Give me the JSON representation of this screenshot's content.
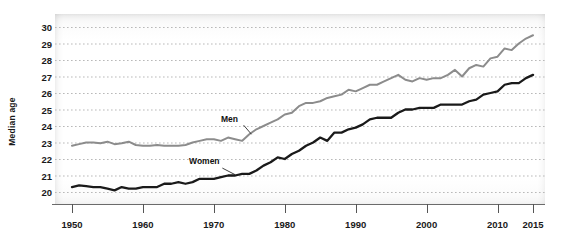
{
  "chart_data": {
    "type": "line",
    "title": "",
    "xlabel": "",
    "ylabel": "Median age",
    "xlim": [
      1950,
      2015
    ],
    "ylim": [
      20,
      30
    ],
    "grid": true,
    "legend_position": "inline-annotation",
    "xticks": [
      1950,
      1960,
      1970,
      1980,
      1990,
      2000,
      2010,
      2015
    ],
    "xtick_labels": [
      "1950",
      "1960",
      "1970",
      "1980",
      "1990",
      "2000",
      "2010",
      "2015"
    ],
    "yticks": [
      20,
      21,
      22,
      23,
      24,
      25,
      26,
      27,
      28,
      29,
      30
    ],
    "ytick_labels": [
      "20",
      "21",
      "22",
      "23",
      "24",
      "25",
      "26",
      "27",
      "28",
      "29",
      "30"
    ],
    "annotations": [
      {
        "text": "Men",
        "x": 1971.0,
        "y": 24.45
      },
      {
        "text": "Women",
        "x": 1966.5,
        "y": 21.85
      }
    ],
    "series": [
      {
        "name": "Men",
        "color": "#8c8c8c",
        "x": [
          1950,
          1951,
          1952,
          1953,
          1954,
          1955,
          1956,
          1957,
          1958,
          1959,
          1960,
          1961,
          1962,
          1963,
          1964,
          1965,
          1966,
          1967,
          1968,
          1969,
          1970,
          1971,
          1972,
          1973,
          1974,
          1975,
          1976,
          1977,
          1978,
          1979,
          1980,
          1981,
          1982,
          1983,
          1984,
          1985,
          1986,
          1987,
          1988,
          1989,
          1990,
          1991,
          1992,
          1993,
          1994,
          1995,
          1996,
          1997,
          1998,
          1999,
          2000,
          2001,
          2002,
          2003,
          2004,
          2005,
          2006,
          2007,
          2008,
          2009,
          2010,
          2011,
          2012,
          2013,
          2014,
          2015
        ],
        "values": [
          22.8,
          22.9,
          23.0,
          23.0,
          22.95,
          23.05,
          22.9,
          22.95,
          23.05,
          22.85,
          22.8,
          22.8,
          22.85,
          22.8,
          22.8,
          22.8,
          22.85,
          23.0,
          23.1,
          23.2,
          23.2,
          23.1,
          23.3,
          23.2,
          23.1,
          23.5,
          23.8,
          24.0,
          24.2,
          24.4,
          24.7,
          24.8,
          25.2,
          25.4,
          25.4,
          25.5,
          25.7,
          25.8,
          25.9,
          26.2,
          26.1,
          26.3,
          26.5,
          26.5,
          26.7,
          26.9,
          27.1,
          26.8,
          26.7,
          26.9,
          26.8,
          26.9,
          26.9,
          27.1,
          27.4,
          27.0,
          27.5,
          27.7,
          27.6,
          28.1,
          28.2,
          28.7,
          28.6,
          29.0,
          29.3,
          29.5
        ]
      },
      {
        "name": "Women",
        "color": "#1a1a1a",
        "x": [
          1950,
          1951,
          1952,
          1953,
          1954,
          1955,
          1956,
          1957,
          1958,
          1959,
          1960,
          1961,
          1962,
          1963,
          1964,
          1965,
          1966,
          1967,
          1968,
          1969,
          1970,
          1971,
          1972,
          1973,
          1974,
          1975,
          1976,
          1977,
          1978,
          1979,
          1980,
          1981,
          1982,
          1983,
          1984,
          1985,
          1986,
          1987,
          1988,
          1989,
          1990,
          1991,
          1992,
          1993,
          1994,
          1995,
          1996,
          1997,
          1998,
          1999,
          2000,
          2001,
          2002,
          2003,
          2004,
          2005,
          2006,
          2007,
          2008,
          2009,
          2010,
          2011,
          2012,
          2013,
          2014,
          2015
        ],
        "values": [
          20.3,
          20.4,
          20.35,
          20.3,
          20.3,
          20.2,
          20.1,
          20.3,
          20.2,
          20.2,
          20.3,
          20.3,
          20.3,
          20.5,
          20.5,
          20.6,
          20.5,
          20.6,
          20.8,
          20.8,
          20.8,
          20.9,
          21.0,
          21.0,
          21.1,
          21.1,
          21.3,
          21.6,
          21.8,
          22.1,
          22.0,
          22.3,
          22.5,
          22.8,
          23.0,
          23.3,
          23.1,
          23.6,
          23.6,
          23.8,
          23.9,
          24.1,
          24.4,
          24.5,
          24.5,
          24.5,
          24.8,
          25.0,
          25.0,
          25.1,
          25.1,
          25.1,
          25.3,
          25.3,
          25.3,
          25.3,
          25.5,
          25.6,
          25.9,
          26.0,
          26.1,
          26.5,
          26.6,
          26.6,
          26.9,
          27.1
        ]
      }
    ]
  }
}
